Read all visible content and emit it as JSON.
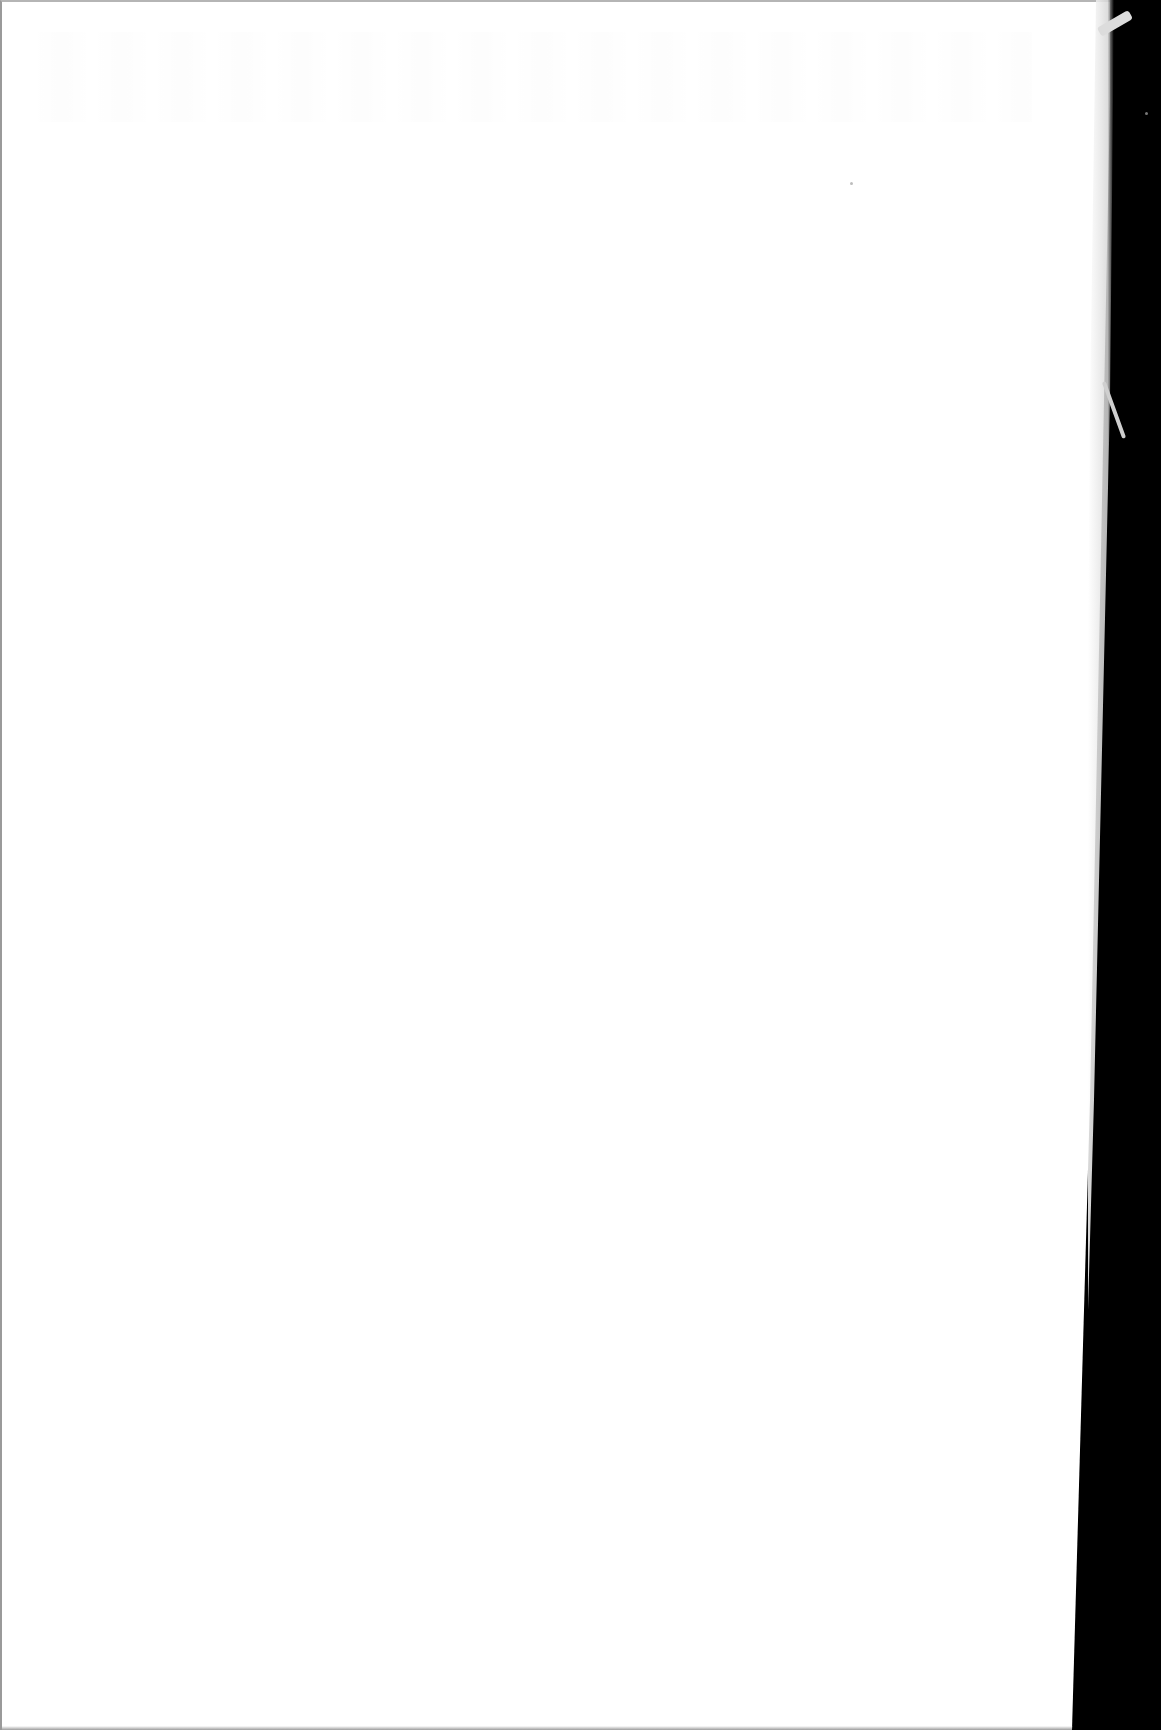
{
  "document": {
    "type": "scanned-page",
    "state": "blank",
    "text_blocks": [],
    "headings": [],
    "page_number": null
  },
  "colors": {
    "paper": "#ffffff",
    "scanner_background": "#000000",
    "page_edge": "#d7d7d7"
  }
}
